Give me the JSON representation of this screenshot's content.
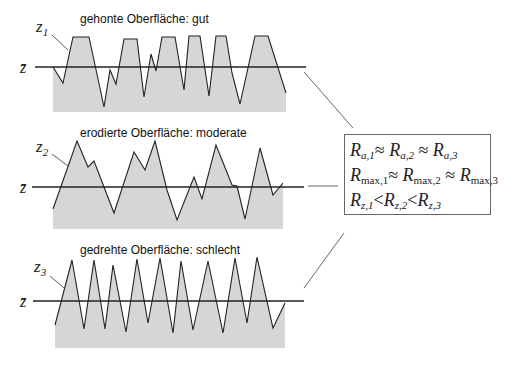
{
  "profiles": [
    {
      "id": "z1",
      "title": "gehonte Oberfläche: gut",
      "label_symbol": "z",
      "label_index": "1",
      "mean_symbol": "z̄",
      "mean_y": 67,
      "fill_bottom": 112,
      "points": "53,67 63,83 73,37 89,37 104,107 110,70 116,84 124,39 137,39 144,97 151,54 156,71 162,37 175,37 184,90 189,36 200,36 209,96 216,36 226,36 232,73 240,104 255,36 268,36 286,93"
    },
    {
      "id": "z2",
      "title": "erodierte Oberfläche: moderate",
      "label_symbol": "z",
      "label_index": "2",
      "mean_symbol": "z̄",
      "mean_y": 187,
      "fill_bottom": 229,
      "points": "53,209 77,141 88,167 94,161 114,213 134,152 145,170 155,141 167,190 177,220 194,177 202,199 216,145 232,185 237,186 245,219 260,148 273,195 283,183"
    },
    {
      "id": "z3",
      "title": "gedrehte Oberfläche: schlecht",
      "label_symbol": "z",
      "label_index": "3",
      "mean_symbol": "z̄",
      "mean_y": 301,
      "fill_bottom": 348,
      "points": "55,325 72,260 84,329 94,260 105,329 113,265 126,332 137,259 148,323 160,258 173,333 181,261 193,330 208,261 223,333 235,258 247,323 257,257 273,328 285,303"
    }
  ],
  "relations": [
    {
      "symbol": "R",
      "s1": "a,1",
      "op1": "≈",
      "s2": "a,2",
      "op2": "≈",
      "s3": "a,3"
    },
    {
      "symbol": "R",
      "s1": "max,1",
      "op1": "≈",
      "s2": "max,2",
      "op2": "≈",
      "s3": "max,3"
    },
    {
      "symbol": "R",
      "s1": "z,1",
      "op1": "<",
      "s2": "z,2",
      "op2": "<",
      "s3": "z,3"
    }
  ],
  "colors": {
    "fill": "#d6d6d6",
    "line": "#222222",
    "connector": "#555555",
    "box_border": "#666666"
  }
}
